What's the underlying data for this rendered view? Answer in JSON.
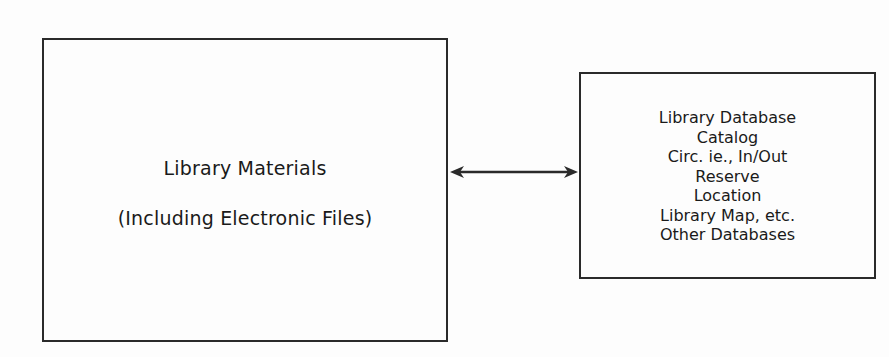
{
  "diagram": {
    "left_box": {
      "title": "Library Materials",
      "subtitle": "(Including Electronic Files)"
    },
    "connector": {
      "type": "bidirectional-arrow",
      "color": "#2a2a2a"
    },
    "right_box": {
      "lines": [
        "Library Database",
        "Catalog",
        "Circ. ie., In/Out",
        "Reserve",
        "Location",
        "Library Map, etc.",
        "Other Databases"
      ]
    }
  }
}
